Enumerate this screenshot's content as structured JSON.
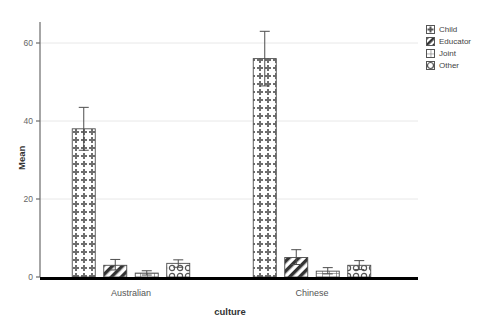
{
  "chart_data": {
    "type": "bar",
    "title": "",
    "subtitle": "",
    "xlabel": "culture",
    "ylabel": "Mean",
    "categories": [
      "Australian",
      "Chinese"
    ],
    "ylim": [
      0,
      68
    ],
    "yticks": [
      0,
      20,
      40,
      60
    ],
    "ytick_labels": [
      "0",
      "20",
      "40",
      "60"
    ],
    "grid": true,
    "grid_axis": "y",
    "legend_position": "right",
    "error_bars": "95% CI",
    "series": [
      {
        "name": "Child",
        "pattern": "dotted-cross",
        "values": [
          38,
          56
        ],
        "error_upper": [
          43.5,
          63
        ],
        "error_lower": [
          32.5,
          49
        ]
      },
      {
        "name": "Educator",
        "pattern": "diagonal-stripe",
        "values": [
          3,
          5
        ],
        "error_upper": [
          4.5,
          7
        ],
        "error_lower": [
          1.8,
          3.2
        ]
      },
      {
        "name": "Joint",
        "pattern": "grid-cross",
        "values": [
          1,
          1.5
        ],
        "error_upper": [
          1.6,
          2.4
        ],
        "error_lower": [
          0.5,
          0.8
        ]
      },
      {
        "name": "Other",
        "pattern": "circles",
        "values": [
          3.5,
          3
        ],
        "error_upper": [
          4.4,
          4.2
        ],
        "error_lower": [
          2.5,
          1.9
        ]
      }
    ]
  },
  "legend": {
    "items": [
      {
        "label": "Child",
        "icon": "pattern-swatch-dotted-cross"
      },
      {
        "label": "Educator",
        "icon": "pattern-swatch-diagonal-stripe"
      },
      {
        "label": "Joint",
        "icon": "pattern-swatch-grid-cross"
      },
      {
        "label": "Other",
        "icon": "pattern-swatch-circles"
      }
    ]
  },
  "axes": {
    "y_title": "Mean",
    "x_title": "culture",
    "y_tick_0": "0",
    "y_tick_1": "20",
    "y_tick_2": "40",
    "y_tick_3": "60",
    "x_cat_0": "Australian",
    "x_cat_1": "Chinese"
  },
  "colors": {
    "axis": "#6b6b6b",
    "grid": "#e8e8e8",
    "bar_outline": "#4d4d4d",
    "baseline": "#000000",
    "text": "#555555",
    "background": "#ffffff"
  }
}
